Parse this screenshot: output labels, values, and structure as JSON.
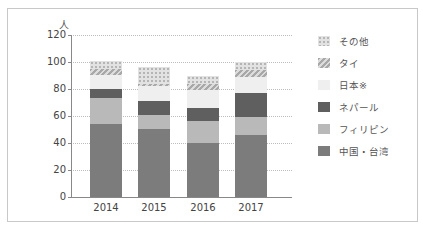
{
  "chart_data": {
    "type": "bar",
    "stacked": true,
    "title": "",
    "xlabel": "",
    "ylabel": "人",
    "ylim": [
      0,
      120
    ],
    "yticks": [
      0,
      20,
      40,
      60,
      80,
      100,
      120
    ],
    "grid": true,
    "legend_position": "right",
    "categories": [
      "2014",
      "2015",
      "2016",
      "2017"
    ],
    "series": [
      {
        "name": "中国・台湾",
        "values": [
          54,
          50,
          40,
          46
        ]
      },
      {
        "name": "フィリピン",
        "values": [
          19,
          11,
          16,
          13
        ]
      },
      {
        "name": "ネパール",
        "values": [
          7,
          10,
          10,
          18
        ]
      },
      {
        "name": "日本※",
        "values": [
          10,
          11,
          13,
          12
        ]
      },
      {
        "name": "タイ",
        "values": [
          5,
          2,
          5,
          5
        ]
      },
      {
        "name": "その他",
        "values": [
          6,
          12,
          6,
          6
        ]
      }
    ]
  },
  "axis": {
    "unit": "人",
    "yticks": [
      "0",
      "20",
      "40",
      "60",
      "80",
      "100",
      "120"
    ],
    "xlabels": [
      "2014",
      "2015",
      "2016",
      "2017"
    ]
  },
  "legend": [
    {
      "label": "その他",
      "key": "others"
    },
    {
      "label": "タイ",
      "key": "thai"
    },
    {
      "label": "日本※",
      "key": "japan"
    },
    {
      "label": "ネパール",
      "key": "nepal"
    },
    {
      "label": "フィリピン",
      "key": "phil"
    },
    {
      "label": "中国・台湾",
      "key": "china"
    }
  ]
}
